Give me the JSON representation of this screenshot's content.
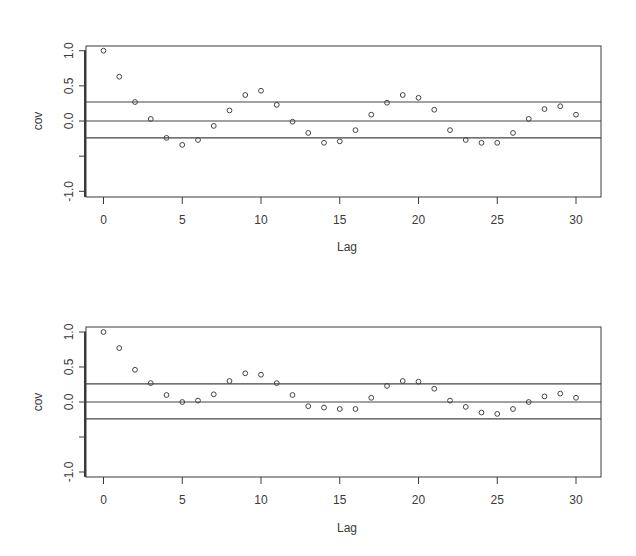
{
  "chart_data": [
    {
      "type": "scatter",
      "title": "",
      "xlabel": "Lag",
      "ylabel": "cov",
      "xlim": [
        -1,
        31
      ],
      "ylim": [
        -1.1,
        1.07
      ],
      "x_ticks": [
        0,
        5,
        10,
        15,
        20,
        25,
        30
      ],
      "x_tick_labels": [
        "0",
        "5",
        "10",
        "15",
        "20",
        "25",
        "30"
      ],
      "y_ticks": [
        1.0,
        0.5,
        0.0,
        -0.5,
        -1.0
      ],
      "y_tick_labels": [
        "1.0",
        "0.5",
        "0.0",
        "",
        "-1.0"
      ],
      "grid": false,
      "reference_lines": [
        0.27,
        0.0,
        -0.24
      ],
      "x": [
        0,
        1,
        2,
        3,
        4,
        5,
        6,
        7,
        8,
        9,
        10,
        11,
        12,
        13,
        14,
        15,
        16,
        17,
        18,
        19,
        20,
        21,
        22,
        23,
        24,
        25,
        26,
        27,
        28,
        29,
        30
      ],
      "values": [
        1.0,
        0.63,
        0.27,
        0.03,
        -0.24,
        -0.34,
        -0.27,
        -0.07,
        0.15,
        0.37,
        0.43,
        0.23,
        -0.01,
        -0.17,
        -0.31,
        -0.29,
        -0.13,
        0.09,
        0.26,
        0.37,
        0.33,
        0.16,
        -0.13,
        -0.27,
        -0.31,
        -0.31,
        -0.17,
        0.03,
        0.17,
        0.21,
        0.09
      ]
    },
    {
      "type": "scatter",
      "title": "",
      "xlabel": "Lag",
      "ylabel": "cov",
      "xlim": [
        -1,
        31
      ],
      "ylim": [
        -1.07,
        1.07
      ],
      "x_ticks": [
        0,
        5,
        10,
        15,
        20,
        25,
        30
      ],
      "x_tick_labels": [
        "0",
        "5",
        "10",
        "15",
        "20",
        "25",
        "30"
      ],
      "y_ticks": [
        1.0,
        0.5,
        0.0,
        -0.5,
        -1.0
      ],
      "y_tick_labels": [
        "1.0",
        "0.5",
        "0.0",
        "",
        "-1.0"
      ],
      "grid": false,
      "reference_lines": [
        0.26,
        0.0,
        -0.24
      ],
      "x": [
        0,
        1,
        2,
        3,
        4,
        5,
        6,
        7,
        8,
        9,
        10,
        11,
        12,
        13,
        14,
        15,
        16,
        17,
        18,
        19,
        20,
        21,
        22,
        23,
        24,
        25,
        26,
        27,
        28,
        29,
        30
      ],
      "values": [
        1.0,
        0.77,
        0.46,
        0.27,
        0.1,
        0.0,
        0.02,
        0.11,
        0.3,
        0.41,
        0.39,
        0.27,
        0.1,
        -0.06,
        -0.08,
        -0.1,
        -0.1,
        0.06,
        0.23,
        0.3,
        0.29,
        0.19,
        0.02,
        -0.07,
        -0.15,
        -0.17,
        -0.1,
        0.0,
        0.08,
        0.12,
        0.06
      ]
    }
  ],
  "plots": [
    {
      "xlabel": "Lag",
      "ylabel": "cov"
    },
    {
      "xlabel": "Lag",
      "ylabel": "cov"
    }
  ],
  "colors": {
    "axis": "#3a3a3a",
    "line": "#444444",
    "point": "#444444",
    "text": "#3a3a3a"
  }
}
